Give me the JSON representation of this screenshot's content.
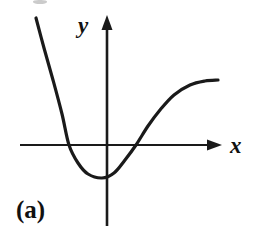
{
  "figure": {
    "panel_label": "(a)",
    "background_color": "#ffffff",
    "stroke_color": "#1a1a1a",
    "width": 259,
    "height": 251
  },
  "axes": {
    "x_label": "x",
    "y_label": "y",
    "x_axis": {
      "start_x": 20,
      "end_x": 222,
      "y": 145,
      "arrow": "right-arrow-head",
      "stroke_width": 2.2
    },
    "y_axis": {
      "x": 107,
      "start_y": 15,
      "end_y": 226,
      "arrow": "up-arrow-head",
      "stroke_width": 2.6
    },
    "origin": {
      "x": 107,
      "y": 145
    }
  },
  "chart_data": {
    "type": "line",
    "title": "(a)",
    "xlabel": "x",
    "ylabel": "y",
    "grid": false,
    "legend": null,
    "axes_style": "arrow-terminated cartesian axes, no tick marks, no tick labels",
    "x_axis_crossings_px": [
      69,
      136
    ],
    "local_minimum_px": {
      "x": 102,
      "y": 178
    },
    "curve_endpoints_px": {
      "start": {
        "x": 36,
        "y": 18
      },
      "end": {
        "x": 218,
        "y": 80
      }
    },
    "path_points_px": [
      {
        "x": 36,
        "y": 18
      },
      {
        "x": 44,
        "y": 48
      },
      {
        "x": 53,
        "y": 80
      },
      {
        "x": 62,
        "y": 114
      },
      {
        "x": 69,
        "y": 145
      },
      {
        "x": 78,
        "y": 163
      },
      {
        "x": 88,
        "y": 174
      },
      {
        "x": 102,
        "y": 178
      },
      {
        "x": 114,
        "y": 173
      },
      {
        "x": 125,
        "y": 160
      },
      {
        "x": 136,
        "y": 145
      },
      {
        "x": 148,
        "y": 126
      },
      {
        "x": 160,
        "y": 110
      },
      {
        "x": 174,
        "y": 95
      },
      {
        "x": 190,
        "y": 85
      },
      {
        "x": 205,
        "y": 81
      },
      {
        "x": 218,
        "y": 80
      }
    ],
    "series": [
      {
        "name": "curve",
        "stroke": "#1a1a1a",
        "stroke_width": 3.2
      }
    ]
  }
}
